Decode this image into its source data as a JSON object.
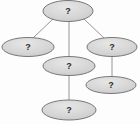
{
  "diagram": {
    "type": "node-link-graph",
    "title": "",
    "canvas": {
      "width": 140,
      "height": 124,
      "background": "#fdfdfd"
    },
    "style": {
      "node_fill": "#d4d4d4",
      "node_fill_highlight": "#e8e8e8",
      "node_stroke": "#6b6b6b",
      "node_stroke_width": 0.9,
      "edge_stroke": "#8a8a8a",
      "edge_stroke_width": 0.9,
      "label_color": "#2b2b2b",
      "label_font_size": 9
    },
    "nodes": [
      {
        "id": "n1",
        "label": "?",
        "cx": 68,
        "cy": 11,
        "rx": 25,
        "ry": 10.5,
        "role": "root-node"
      },
      {
        "id": "n2",
        "label": "?",
        "cx": 28,
        "cy": 47,
        "rx": 26,
        "ry": 9.5,
        "role": "left-node"
      },
      {
        "id": "n3",
        "label": "?",
        "cx": 112,
        "cy": 47,
        "rx": 25,
        "ry": 9.5,
        "role": "right-node"
      },
      {
        "id": "n4",
        "label": "?",
        "cx": 69,
        "cy": 66,
        "rx": 26,
        "ry": 9.5,
        "role": "middle-node"
      },
      {
        "id": "n5",
        "label": "?",
        "cx": 111,
        "cy": 85,
        "rx": 25,
        "ry": 8.5,
        "role": "lower-right-node"
      },
      {
        "id": "n6",
        "label": "?",
        "cx": 69,
        "cy": 110,
        "rx": 27,
        "ry": 10,
        "role": "bottom-node"
      }
    ],
    "edges": [
      {
        "id": "e1",
        "from": "n1",
        "to": "n2",
        "x1": 53,
        "y1": 19,
        "x2": 33,
        "y2": 38,
        "role": "root-to-left"
      },
      {
        "id": "e2",
        "from": "n1",
        "to": "n3",
        "x1": 84,
        "y1": 19,
        "x2": 104,
        "y2": 38,
        "role": "root-to-right"
      },
      {
        "id": "e3",
        "from": "n1",
        "to": "n4",
        "x1": 69,
        "y1": 21,
        "x2": 69,
        "y2": 57,
        "role": "root-to-middle"
      },
      {
        "id": "e4",
        "from": "n3",
        "to": "n5",
        "x1": 112,
        "y1": 56,
        "x2": 112,
        "y2": 77,
        "role": "right-to-lower-right"
      },
      {
        "id": "e5",
        "from": "n4",
        "to": "n6",
        "x1": 69,
        "y1": 75,
        "x2": 69,
        "y2": 100,
        "role": "middle-to-bottom"
      }
    ]
  }
}
